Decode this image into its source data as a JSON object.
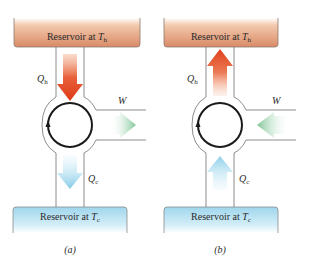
{
  "figure": {
    "panels": [
      {
        "id": "a",
        "caption": "(a)",
        "hot_reservoir": {
          "label_prefix": "Reservoir at ",
          "label_var": "T",
          "label_sub": "h"
        },
        "cold_reservoir": {
          "label_prefix": "Reservoir at ",
          "label_var": "T",
          "label_sub": "c"
        },
        "heat_hot": {
          "var": "Q",
          "sub": "h",
          "direction": "down"
        },
        "heat_cold": {
          "var": "Q",
          "sub": "c",
          "direction": "down"
        },
        "work": {
          "var": "W",
          "direction": "out"
        },
        "cycle_direction": "clockwise"
      },
      {
        "id": "b",
        "caption": "(b)",
        "hot_reservoir": {
          "label_prefix": "Reservoir at ",
          "label_var": "T",
          "label_sub": "h"
        },
        "cold_reservoir": {
          "label_prefix": "Reservoir at ",
          "label_var": "T",
          "label_sub": "c"
        },
        "heat_hot": {
          "var": "Q",
          "sub": "h",
          "direction": "up"
        },
        "heat_cold": {
          "var": "Q",
          "sub": "c",
          "direction": "up"
        },
        "work": {
          "var": "W",
          "direction": "in"
        },
        "cycle_direction": "clockwise"
      }
    ],
    "colors": {
      "hot_reservoir_top": "#d9886a",
      "hot_reservoir_bottom": "#f6d8c4",
      "cold_reservoir_top": "#9fd6ec",
      "cold_reservoir_bottom": "#e6f5fb",
      "hot_arrow": "#e0401e",
      "cold_arrow": "#8fd0ea",
      "work_arrow": "#8cc9a0",
      "outline": "#6b6b6b",
      "cycle": "#1a1a1a"
    }
  }
}
